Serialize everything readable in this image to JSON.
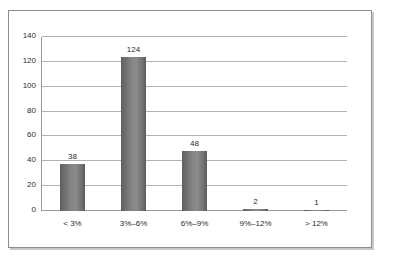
{
  "chart_data": {
    "type": "bar",
    "title": "",
    "subtitle": "",
    "xlabel": "",
    "ylabel": "",
    "categories": [
      "< 3%",
      "3%–6%",
      "6%–9%",
      "9%–12%",
      "> 12%"
    ],
    "values": [
      38,
      124,
      48,
      2,
      1
    ],
    "data_labels": [
      "38",
      "124",
      "48",
      "2",
      "1"
    ],
    "ylim": [
      0,
      140
    ],
    "yticks": [
      0,
      20,
      40,
      60,
      80,
      100,
      120,
      140
    ],
    "ytick_labels": [
      "0",
      "20",
      "40",
      "60",
      "80",
      "100",
      "120",
      "140"
    ],
    "grid": "horizontal",
    "legend": "none",
    "bar_color": "#7b7b7b",
    "gridline_color": "#b3b3b3",
    "axis_color": "#9a9a9a",
    "frame_color": "#8d8d8d",
    "background_color": "#ffffff"
  }
}
